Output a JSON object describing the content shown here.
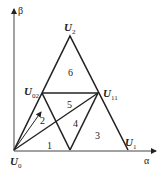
{
  "axes": {
    "x_label": "α",
    "y_label": "β"
  },
  "vertices": [
    {
      "id": "U0",
      "base": "U",
      "sub": "0"
    },
    {
      "id": "U1",
      "base": "U",
      "sub": "1"
    },
    {
      "id": "U2",
      "base": "U",
      "sub": "2"
    },
    {
      "id": "U02",
      "base": "U",
      "sub": "02"
    },
    {
      "id": "U11",
      "base": "U",
      "sub": "11"
    }
  ],
  "regions": [
    "1",
    "2",
    "3",
    "4",
    "5",
    "6"
  ],
  "colors": {
    "line": "#222222",
    "background": "#ffffff"
  }
}
